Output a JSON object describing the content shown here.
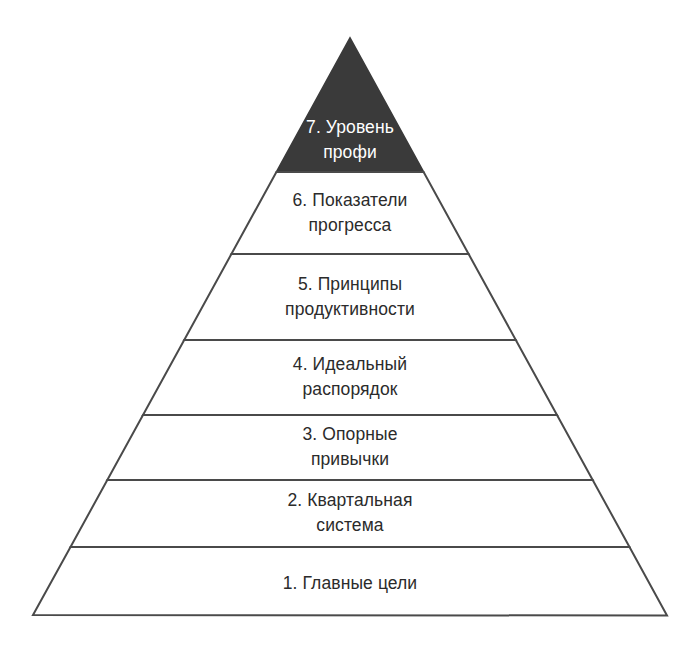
{
  "diagram": {
    "type": "pyramid",
    "title": "",
    "orientation": "apex-up",
    "tier_count": 7,
    "colors": {
      "background": "#ffffff",
      "outline": "#4a4a4a",
      "highlight_fill": "#3a3a3a",
      "highlight_text": "#ffffff",
      "text": "#2b2b2b"
    },
    "geometry": {
      "apex_x": 350,
      "apex_y": 38,
      "base_left_x": 33,
      "base_right_x": 667,
      "base_y": 615,
      "divider_y": [
        172,
        254,
        340,
        415,
        480,
        547
      ]
    },
    "tiers": [
      {
        "level": 7,
        "label": "7. Уровень\nпрофи",
        "line1": "7. Уровень",
        "line2": "профи",
        "fill": "#3a3a3a",
        "text_color": "#ffffff",
        "center_x": 350,
        "center_y": 140
      },
      {
        "level": 6,
        "label": "6. Показатели\nпрогресса",
        "line1": "6. Показатели",
        "line2": "прогресса",
        "fill": "#ffffff",
        "text_color": "#2b2b2b",
        "center_x": 350,
        "center_y": 213
      },
      {
        "level": 5,
        "label": "5. Принципы\nпродуктивности",
        "line1": "5. Принципы",
        "line2": "продуктивности",
        "fill": "#ffffff",
        "text_color": "#2b2b2b",
        "center_x": 350,
        "center_y": 297
      },
      {
        "level": 4,
        "label": "4. Идеальный\nраспорядок",
        "line1": "4. Идеальный",
        "line2": "распорядок",
        "fill": "#ffffff",
        "text_color": "#2b2b2b",
        "center_x": 350,
        "center_y": 377
      },
      {
        "level": 3,
        "label": "3. Опорные\nпривычки",
        "line1": "3. Опорные",
        "line2": "привычки",
        "fill": "#ffffff",
        "text_color": "#2b2b2b",
        "center_x": 350,
        "center_y": 447
      },
      {
        "level": 2,
        "label": "2. Квартальная\nсистема",
        "line1": "2. Квартальная",
        "line2": "система",
        "fill": "#ffffff",
        "text_color": "#2b2b2b",
        "center_x": 350,
        "center_y": 513
      },
      {
        "level": 1,
        "label": "1. Главные цели",
        "line1": "1. Главные цели",
        "line2": "",
        "fill": "#ffffff",
        "text_color": "#2b2b2b",
        "center_x": 350,
        "center_y": 583
      }
    ]
  }
}
